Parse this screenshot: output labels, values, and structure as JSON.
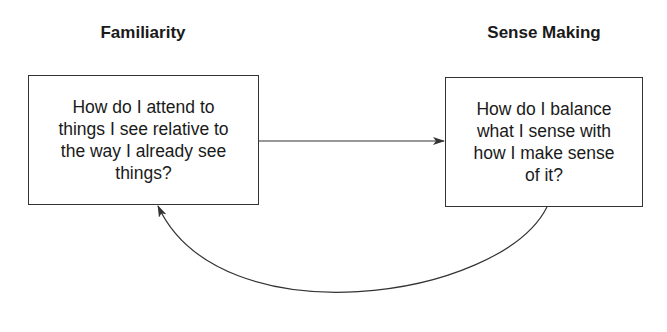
{
  "nodes": {
    "left": {
      "title": "Familiarity",
      "text": "How do I attend to\nthings I see relative to\nthe way I already see\nthings?"
    },
    "right": {
      "title": "Sense Making",
      "text": "How do I balance\nwhat I sense with\nhow I make sense\nof it?"
    }
  },
  "edges": [
    {
      "from": "left",
      "to": "right",
      "shape": "straight"
    },
    {
      "from": "right",
      "to": "left",
      "shape": "curved"
    }
  ],
  "colors": {
    "stroke": "#333333",
    "text": "#1a1a1a",
    "background": "#ffffff"
  }
}
